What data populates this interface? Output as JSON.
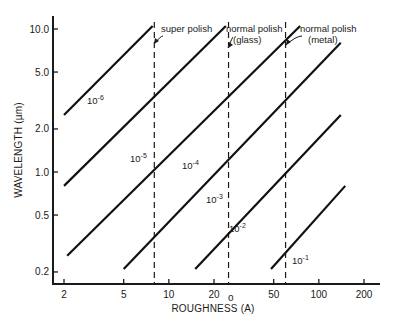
{
  "chart_data": {
    "type": "line",
    "title": "",
    "xlabel": "ROUGHNESS (Å)",
    "ylabel": "WAVELENGTH (µm)",
    "xscale": "log",
    "yscale": "log",
    "xlim": [
      1.6,
      230
    ],
    "ylim": [
      0.18,
      12
    ],
    "x_ticks": [
      2,
      5,
      10,
      20,
      50,
      100,
      200
    ],
    "x_tick_labels": [
      "2",
      "5",
      "10",
      "20",
      "50",
      "100",
      "200"
    ],
    "y_ticks": [
      0.2,
      0.5,
      1.0,
      2.0,
      5.0,
      10.0
    ],
    "y_tick_labels": [
      "0.2",
      "0.5",
      "1.0",
      "2.0",
      "5.0",
      "10.0"
    ],
    "grid": false,
    "legend": "inline labels",
    "series": [
      {
        "name": "10^-6",
        "label_base": "10",
        "label_exp": "-6",
        "x": [
          2.0,
          7.8
        ],
        "y": [
          2.5,
          10.5
        ]
      },
      {
        "name": "10^-5",
        "label_base": "10",
        "label_exp": "-5",
        "x": [
          2.0,
          24
        ],
        "y": [
          0.8,
          10.5
        ]
      },
      {
        "name": "10^-4",
        "label_base": "10",
        "label_exp": "-4",
        "x": [
          2.1,
          75
        ],
        "y": [
          0.26,
          10.5
        ]
      },
      {
        "name": "10^-3",
        "label_base": "10",
        "label_exp": "-3",
        "x": [
          5.0,
          140
        ],
        "y": [
          0.21,
          8.0
        ]
      },
      {
        "name": "10^-2",
        "label_base": "10",
        "label_exp": "-2",
        "x": [
          15,
          140
        ],
        "y": [
          0.21,
          2.5
        ]
      },
      {
        "name": "10^-1",
        "label_base": "10",
        "label_exp": "-1",
        "x": [
          48,
          150
        ],
        "y": [
          0.21,
          0.8
        ]
      }
    ],
    "annotations": [
      {
        "text": "super polish",
        "x": 8,
        "style": "dashed vertical line"
      },
      {
        "text": "normal polish",
        "text2": "(glass)",
        "x": 25,
        "style": "dashed vertical line"
      },
      {
        "text": "normal polish",
        "text2": "(metal)",
        "x": 60,
        "style": "dashed vertical line"
      }
    ]
  },
  "axis": {
    "xlabel_main": "ROUGHNESS (A)",
    "xlabel_ring": "o",
    "ylabel": "WAVELENGTH (µm)"
  }
}
